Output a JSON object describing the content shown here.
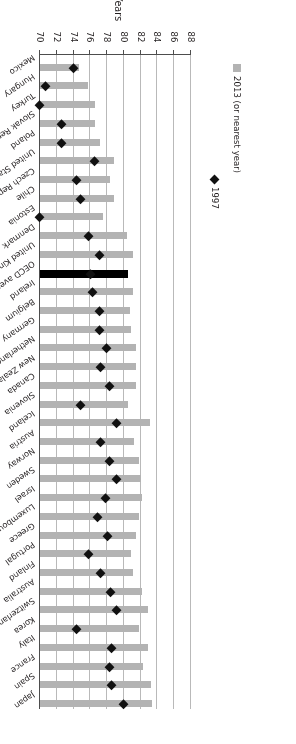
{
  "chart_data": {
    "type": "bar",
    "title": "",
    "xlabel": "",
    "ylabel": "Years",
    "ylim": [
      70,
      88
    ],
    "yticks": [
      88,
      86,
      84,
      82,
      80,
      78,
      76,
      74,
      72,
      70
    ],
    "grid": true,
    "orientation": "horizontal",
    "legend_position": "left",
    "legend": [
      {
        "label": "2013 (or nearest year)",
        "marker": "square",
        "color": "#b3b3b3"
      },
      {
        "label": "1997",
        "marker": "diamond",
        "color": "#111111"
      }
    ],
    "categories": [
      "Japan",
      "Spain",
      "France",
      "Italy",
      "Korea",
      "Switzerland",
      "Australia",
      "Finland",
      "Portugal",
      "Greece",
      "Luxembourg",
      "Israel",
      "Sweden",
      "Norway",
      "Austria",
      "Iceland",
      "Slovenia",
      "Canada",
      "New Zealand",
      "Netherlands",
      "Germany",
      "Belgium",
      "Ireland",
      "OECD average (2013)",
      "United Kingdom",
      "Denmark",
      "Estonia",
      "Chile",
      "Czech Republic",
      "United States",
      "Poland",
      "Slovak Republic",
      "Turkey",
      "Hungary",
      "Mexico"
    ],
    "series": [
      {
        "name": "2013 (or nearest year)",
        "values": [
          83.4,
          83.2,
          82.3,
          82.9,
          81.8,
          82.9,
          82.2,
          81.1,
          80.9,
          81.4,
          81.8,
          82.1,
          82.0,
          81.8,
          81.2,
          83.1,
          80.5,
          81.5,
          81.5,
          81.4,
          80.9,
          80.7,
          81.1,
          80.5,
          81.1,
          80.4,
          77.5,
          78.8,
          78.3,
          78.8,
          77.1,
          76.6,
          76.6,
          75.7,
          74.6
        ]
      },
      {
        "name": "1997",
        "values": [
          80.0,
          78.5,
          78.3,
          78.5,
          74.4,
          79.1,
          78.4,
          77.2,
          75.8,
          78.0,
          76.8,
          77.8,
          79.1,
          78.3,
          77.2,
          79.1,
          74.8,
          78.3,
          77.2,
          77.9,
          77.1,
          77.1,
          76.3,
          76.0,
          77.1,
          75.8,
          69.9,
          74.8,
          74.4,
          76.5,
          72.6,
          72.6,
          70.0,
          70.7,
          74.0
        ]
      }
    ]
  },
  "legend_labels": {
    "series_2013": "2013 (or nearest year)",
    "series_1997": "1997"
  },
  "axis": {
    "y_title": "Years"
  }
}
